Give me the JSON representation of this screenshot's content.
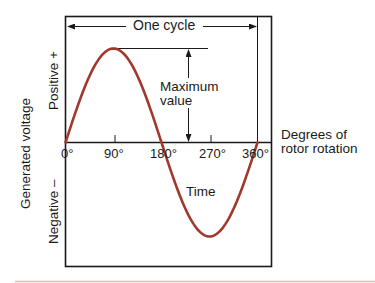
{
  "title": "One cycle",
  "labels": {
    "max_value_line1": "Maximum",
    "max_value_line2": "value",
    "time": "Time",
    "x_axis_line1": "Degrees of",
    "x_axis_line2": "rotor rotation",
    "y_axis": "Generated voltage",
    "positive": "Positive +",
    "negative": "Negative –"
  },
  "ticks": [
    "0°",
    "90°",
    "180°",
    "270°",
    "360°"
  ],
  "colors": {
    "curve": "#a0392b",
    "frame": "#1a1a1a",
    "bottom_rule": "#e8b8b0"
  },
  "chart_data": {
    "type": "line",
    "title": "One cycle",
    "xlabel": "Degrees of rotor rotation",
    "ylabel": "Generated voltage",
    "x": [
      0,
      45,
      90,
      135,
      180,
      225,
      270,
      315,
      360
    ],
    "series": [
      {
        "name": "Generated voltage (sine)",
        "values": [
          0,
          0.707,
          1,
          0.707,
          0,
          -0.707,
          -1,
          -0.707,
          0
        ]
      }
    ],
    "x_ticks": [
      "0°",
      "90°",
      "180°",
      "270°",
      "360°"
    ],
    "y_regions": [
      "Positive +",
      "Negative –"
    ],
    "annotations": [
      "One cycle",
      "Maximum value",
      "Time"
    ],
    "xlim": [
      0,
      360
    ],
    "ylim": [
      -1,
      1
    ],
    "grid": false
  }
}
